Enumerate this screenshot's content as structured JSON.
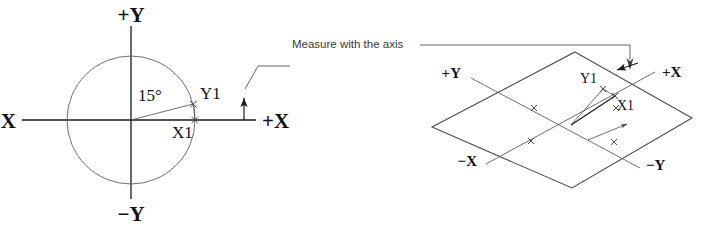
{
  "figure": {
    "title": "Measure with the axis",
    "background_color": "#ffffff",
    "line_color": "#1a1a1a",
    "accent_color": "#555555"
  },
  "annotation": {
    "text": "Measure with the axis"
  },
  "flat_view": {
    "name": "flat-circle-view",
    "axis_labels": {
      "plus_y": "+Y",
      "minus_y": "−Y",
      "plus_x": "+X",
      "minus_x": "−X"
    },
    "angle": {
      "value": "15°",
      "degrees": 15
    },
    "points": {
      "y1": "Y1",
      "x1": "X1"
    },
    "circle": {
      "center_x": 131,
      "center_y": 120,
      "radius": 64
    }
  },
  "iso_view": {
    "name": "isometric-plane-view",
    "axis_labels": {
      "plus_y": "+Y",
      "minus_y": "−Y",
      "plus_x": "+X",
      "minus_x": "−X"
    },
    "points": {
      "y1": "Y1",
      "x1": "X1"
    },
    "diamond": {
      "top_x": 575,
      "top_y": 52,
      "right_x": 692,
      "right_y": 118,
      "bottom_x": 572,
      "bottom_y": 188,
      "left_x": 432,
      "left_y": 127
    }
  }
}
